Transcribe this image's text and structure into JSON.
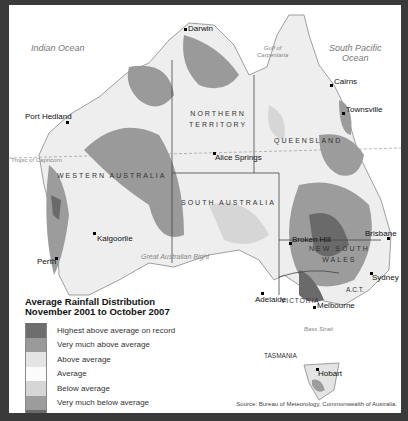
{
  "map": {
    "oceans": {
      "indian": "Indian Ocean",
      "south_pacific": [
        "South Pacific",
        "Ocean"
      ],
      "gulf": [
        "Gulf of",
        "Carpentaria"
      ],
      "bight": "Great Australian Bight",
      "bass_strait": "Bass Strait",
      "tropic": "Tropic of Capricorn"
    },
    "states": {
      "wa": "WESTERN AUSTRALIA",
      "nt": [
        "NORTHERN",
        "TERRITORY"
      ],
      "qld": "QUEENSLAND",
      "sa": "SOUTH AUSTRALIA",
      "nsw": [
        "NEW SOUTH",
        "WALES"
      ],
      "vic": "VICTORIA",
      "act": "A.C.T.",
      "tas": "TASMANIA"
    },
    "cities": [
      {
        "name": "Darwin"
      },
      {
        "name": "Cairns"
      },
      {
        "name": "Townsville"
      },
      {
        "name": "Port Hedland"
      },
      {
        "name": "Alice Springs"
      },
      {
        "name": "Brisbane"
      },
      {
        "name": "Broken Hill"
      },
      {
        "name": "Kalgoorlie"
      },
      {
        "name": "Perth"
      },
      {
        "name": "Adelaide"
      },
      {
        "name": "Sydney"
      },
      {
        "name": "Melbourne"
      },
      {
        "name": "Hobart"
      }
    ]
  },
  "legend": {
    "title": [
      "Average Rainfall Distribution",
      "November 2001 to October 2007"
    ],
    "items": [
      {
        "label": "Highest above average on record",
        "color": "#6e6e6e"
      },
      {
        "label": "Very much above average",
        "color": "#9a9a9a"
      },
      {
        "label": "Above average",
        "color": "#e4e4e4"
      },
      {
        "label": "Average",
        "color": "#fbfbfb"
      },
      {
        "label": "Below average",
        "color": "#d6d6d6"
      },
      {
        "label": "Very much below average",
        "color": "#9c9c9c"
      },
      {
        "label": "Lowest below average on record",
        "color": "#6a6a6a"
      }
    ]
  },
  "source": "Source: Bureau of Meteorology, Commonwealth of Australia."
}
